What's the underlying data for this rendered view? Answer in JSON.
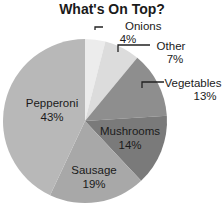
{
  "chart_data": {
    "type": "pie",
    "title": "What's On Top?",
    "categories": [
      "Onions",
      "Other",
      "Vegetables",
      "Mushrooms",
      "Sausage",
      "Pepperoni"
    ],
    "values": [
      4,
      7,
      13,
      14,
      19,
      43
    ],
    "labels": [
      "4%",
      "7%",
      "13%",
      "14%",
      "19%",
      "43%"
    ],
    "colors": [
      "#ececec",
      "#dcdcdc",
      "#8e8e8e",
      "#7a7a7a",
      "#a8a8a8",
      "#b8b8b8"
    ],
    "legend": "none"
  },
  "slices": [
    {
      "name": "Onions",
      "pct": "4%"
    },
    {
      "name": "Other",
      "pct": "7%"
    },
    {
      "name": "Vegetables",
      "pct": "13%"
    },
    {
      "name": "Mushrooms",
      "pct": "14%"
    },
    {
      "name": "Sausage",
      "pct": "19%"
    },
    {
      "name": "Pepperoni",
      "pct": "43%"
    }
  ]
}
